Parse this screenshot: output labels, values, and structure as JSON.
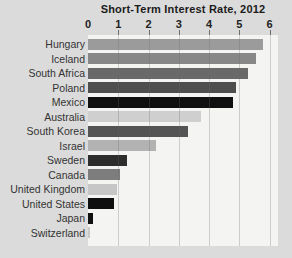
{
  "title": "Short-Term Interest Rate, 2012",
  "axis": {
    "min": 0,
    "max": 6,
    "tick_labels": [
      "0",
      "1",
      "2",
      "3",
      "4",
      "5",
      "6"
    ]
  },
  "chart_data": {
    "type": "bar",
    "orientation": "horizontal",
    "title": "Short-Term Interest Rate, 2012",
    "categories": [
      "Hungary",
      "Iceland",
      "South Africa",
      "Poland",
      "Mexico",
      "Australia",
      "South Korea",
      "Israel",
      "Sweden",
      "Canada",
      "United Kingdom",
      "United States",
      "Japan",
      "Switzerland"
    ],
    "values": [
      5.8,
      5.55,
      5.3,
      4.9,
      4.8,
      3.75,
      3.3,
      2.25,
      1.3,
      1.05,
      0.95,
      0.85,
      0.15,
      0.08
    ],
    "bar_colors": [
      "#9b9b9b",
      "#878787",
      "#696969",
      "#4e4e4e",
      "#101010",
      "#cfcfcf",
      "#545454",
      "#b2b2b2",
      "#2d2d2d",
      "#7d7d7d",
      "#c6c6c6",
      "#0f0f0f",
      "#111111",
      "#c9c9c9"
    ],
    "xlabel": "",
    "ylabel": "",
    "xlim": [
      0,
      6
    ],
    "x_ticks": [
      0,
      1,
      2,
      3,
      4,
      5,
      6
    ],
    "grid": true,
    "legend": false
  },
  "colors": {
    "background": "#dbdbdb",
    "plot_background": "#f4f4f2",
    "gridline": "#c9c9c9",
    "tick_mark": "#6d6d6d",
    "title_text": "#1b1b1b",
    "label_text": "#333333"
  }
}
